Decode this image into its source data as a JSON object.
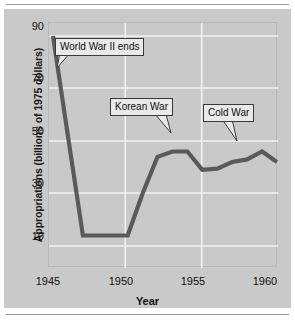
{
  "chart_data": {
    "type": "line",
    "title": "",
    "xlabel": "Year",
    "ylabel": "Appropriations (billions of 1975 dollars)",
    "xlim": [
      1945,
      1960
    ],
    "ylim": [
      0,
      96
    ],
    "grid": true,
    "legend": "none",
    "x_ticks": [
      1945,
      1950,
      1955,
      1960
    ],
    "y_ticks": [
      10,
      30,
      50,
      70,
      90
    ],
    "x": [
      1945,
      1946,
      1947,
      1948,
      1949,
      1950,
      1951,
      1952,
      1953,
      1954,
      1955,
      1956,
      1957,
      1958,
      1959,
      1960
    ],
    "values": [
      90,
      52,
      14,
      14,
      14,
      14,
      30,
      44,
      46,
      46,
      39,
      39.5,
      42,
      43,
      46,
      42
    ],
    "series": [
      {
        "name": "Appropriations",
        "values": [
          90,
          52,
          14,
          14,
          14,
          14,
          30,
          44,
          46,
          46,
          39,
          39.5,
          42,
          43,
          46,
          42
        ],
        "color": "#5a5a5a"
      }
    ],
    "annotations": [
      {
        "label": "World War II ends",
        "x": 1946.1,
        "y": 71
      },
      {
        "label": "Korean War",
        "x": 1952.6,
        "y": 49
      },
      {
        "label": "Cold War",
        "x": 1958.5,
        "y": 45
      }
    ]
  },
  "axes": {
    "y_title": "Appropriations (billions of 1975 dollars)",
    "x_title": "Year",
    "y_tick_labels": [
      "90",
      "70",
      "50",
      "30",
      "10"
    ],
    "x_tick_labels": [
      "1945",
      "1950",
      "1955",
      "1960"
    ]
  },
  "annotations": {
    "ww2": "World War II ends",
    "korean": "Korean War",
    "cold": "Cold War"
  },
  "colors": {
    "panel": "#c9c9c9",
    "line": "#5a5a5a",
    "grid": "#f2f2f2",
    "callout_fill": "#e9e9e9",
    "callout_border": "#3a3a3a",
    "text": "#111111"
  }
}
